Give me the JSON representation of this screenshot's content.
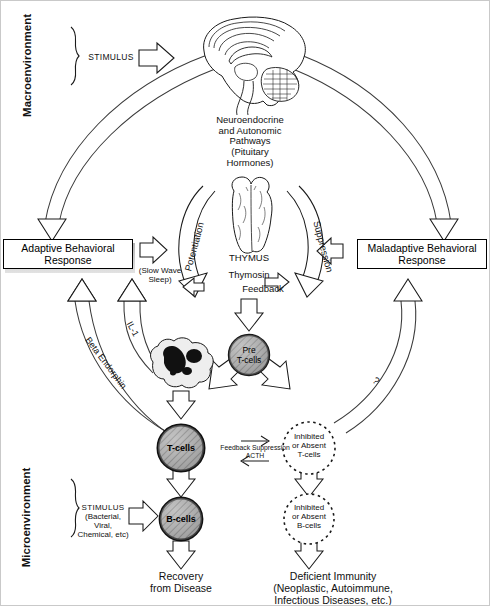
{
  "environments": {
    "macro_label": "Macroenvironment",
    "micro_label": "Microenvironment"
  },
  "stimuli": {
    "macro_stimulus": "STIMULUS",
    "micro_stimulus_line1": "STIMULUS",
    "micro_stimulus_line2": "(Bacterial, Viral,",
    "micro_stimulus_line3": "Chemical, etc)"
  },
  "brain": {
    "organ_name": "brain",
    "pathway_line1": "Neuroendocrine",
    "pathway_line2": "and Autonomic",
    "pathway_line3": "Pathways",
    "pathway_line4": "(Pituitary",
    "pathway_line5": "Hormones)"
  },
  "thymus": {
    "organ_name": "thymus",
    "label": "THYMUS",
    "hormone": "Thymosin",
    "feedback": "Feedback"
  },
  "curved_arrows": {
    "potentiation": "Potentiation",
    "suppression": "Suppression",
    "question_mark": "?"
  },
  "responses": {
    "adaptive_line1": "Adaptive Behavioral",
    "adaptive_line2": "Response",
    "maladaptive_line1": "Maladaptive Behavioral",
    "maladaptive_line2": "Response"
  },
  "mediators": {
    "slow_wave_line1": "(Slow Wave",
    "slow_wave_line2": "Sleep)",
    "il1": "IL-1",
    "beta_endorphin": "Beta Endorphin",
    "feedback_suppression_line1": "Feedback Suppression",
    "feedback_suppression_line2": "ACTH"
  },
  "cells": {
    "pre_t_line1": "Pre",
    "pre_t_line2": "T-cells",
    "macrophage_name": "macrophage",
    "t_cells": "T-cells",
    "b_cells": "B-cells",
    "inhibited_t_line1": "Inhibited",
    "inhibited_t_line2": "or Absent",
    "inhibited_t_line3": "T-cells",
    "inhibited_b_line1": "Inhibited",
    "inhibited_b_line2": "or Absent",
    "inhibited_b_line3": "B-cells"
  },
  "outcomes": {
    "positive_line1": "Recovery",
    "positive_line2": "from Disease",
    "negative_line1": "Deficient Immunity",
    "negative_line2": "(Neoplastic, Autoimmune,",
    "negative_line3": "Infectious Diseases, etc.)"
  },
  "colors": {
    "stroke": "#1a1a1a",
    "background": "#ffffff",
    "cell_fill": "#9a9a9a",
    "frame": "#c9c9c9"
  }
}
